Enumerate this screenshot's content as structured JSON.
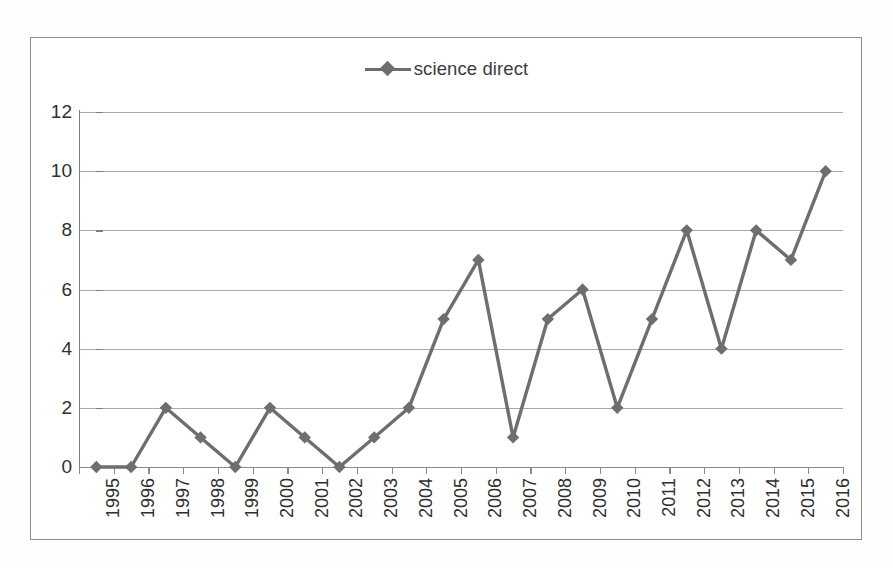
{
  "chart_data": {
    "type": "line",
    "title": "",
    "subtitle": "",
    "xlabel": "",
    "ylabel": "",
    "categories": [
      "1995",
      "1996",
      "1997",
      "1998",
      "1999",
      "2000",
      "2001",
      "2002",
      "2003",
      "2004",
      "2005",
      "2006",
      "2007",
      "2008",
      "2009",
      "2010",
      "2011",
      "2012",
      "2013",
      "2014",
      "2015",
      "2016"
    ],
    "series": [
      {
        "name": "science direct",
        "values": [
          0,
          0,
          2,
          1,
          0,
          2,
          1,
          0,
          1,
          2,
          5,
          7,
          1,
          5,
          6,
          2,
          5,
          8,
          4,
          8,
          7,
          10
        ],
        "color": "#6e6e6e",
        "marker": "diamond"
      }
    ],
    "ylim": [
      0,
      12
    ],
    "yticks": [
      "0",
      "2",
      "4",
      "6",
      "8",
      "10",
      "12"
    ],
    "ytick_values": [
      0,
      2,
      4,
      6,
      8,
      10,
      12
    ],
    "grid": "horizontal",
    "legend_position": "top-center",
    "xtick_rotation": -90
  },
  "legend": {
    "entries": [
      {
        "label": "science direct",
        "marker_color": "#6e6e6e"
      }
    ]
  },
  "colors": {
    "series_line": "#6e6e6e",
    "marker": "#6e6e6e",
    "gridline": "#a9a9a9",
    "axis": "#7d7d7d",
    "frame_border": "#8d8d8d",
    "tick_text": "#2f2f2f",
    "legend_text": "#3b3b3b",
    "background": "#ffffff"
  }
}
